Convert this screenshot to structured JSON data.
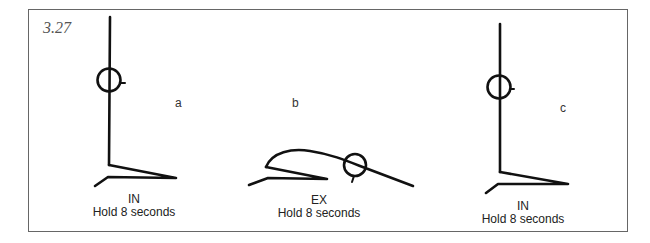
{
  "figure": {
    "number": "3.27",
    "panels": [
      {
        "letter": "a",
        "breath": "IN",
        "instruction": "Hold 8 seconds",
        "pose": "seated-upright"
      },
      {
        "letter": "b",
        "breath": "EX",
        "instruction": "Hold 8 seconds",
        "pose": "seated-forward-bend"
      },
      {
        "letter": "c",
        "breath": "IN",
        "instruction": "Hold 8 seconds",
        "pose": "seated-upright"
      }
    ]
  },
  "colors": {
    "stroke": "#111111",
    "frame": "#666666",
    "text": "#222222",
    "figure_number": "#555555"
  }
}
